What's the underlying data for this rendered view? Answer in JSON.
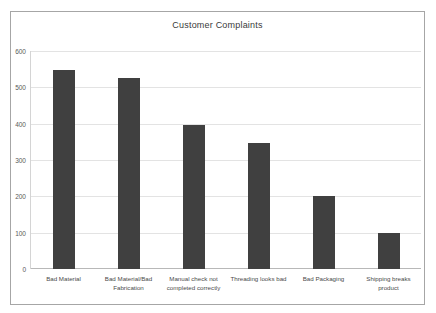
{
  "chart_data": {
    "type": "bar",
    "title": "Customer Complaints",
    "xlabel": "",
    "ylabel": "",
    "categories": [
      "Bad Material",
      "Bad Material/Bad Fabrication",
      "Manual check not completed correctly",
      "Threading looks bad",
      "Bad Packaging",
      "Shipping breaks product"
    ],
    "values": [
      548,
      525,
      395,
      348,
      200,
      100
    ],
    "ylim": [
      0,
      600
    ],
    "yticks": [
      0,
      100,
      200,
      300,
      400,
      500,
      600
    ],
    "ytick_labels": [
      "0",
      "100",
      "200",
      "300",
      "400",
      "500",
      "600"
    ],
    "grid": true,
    "legend": false,
    "bar_color": "#404040",
    "gridline_color": "#e3e3e3",
    "axis_color": "#b8b8b8",
    "border_color": "#a6a6a6",
    "background_color": "#ffffff"
  }
}
